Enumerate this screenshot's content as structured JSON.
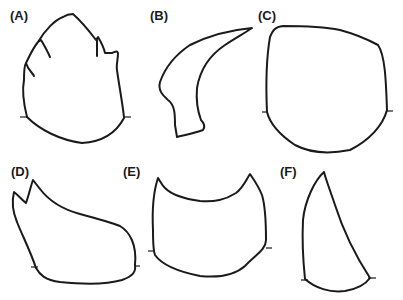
{
  "figure": {
    "panels": [
      {
        "id": "A",
        "label": "(A)",
        "x": 10,
        "y": 9
      },
      {
        "id": "B",
        "label": "(B)",
        "x": 150,
        "y": 9
      },
      {
        "id": "C",
        "label": "(C)",
        "x": 258,
        "y": 9
      },
      {
        "id": "D",
        "label": "(D)",
        "x": 11,
        "y": 165
      },
      {
        "id": "E",
        "label": "(E)",
        "x": 123,
        "y": 165
      },
      {
        "id": "F",
        "label": "(F)",
        "x": 280,
        "y": 165
      }
    ]
  }
}
